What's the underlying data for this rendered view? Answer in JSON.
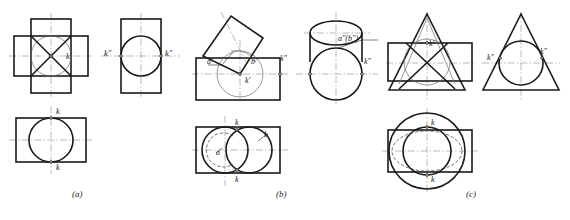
{
  "figure": {
    "title": "",
    "background": "#ffffff",
    "line_color": "#1a1a1a",
    "thin_color": "#5a5a5a",
    "center_color": "#7a7a7a",
    "hidden_color": "#4a4a4a"
  },
  "captions": [
    {
      "id": "cap-a",
      "label": "(a)",
      "x": 78,
      "y": 196
    },
    {
      "id": "cap-b",
      "label": "(b)",
      "x": 282,
      "y": 196
    },
    {
      "id": "cap-c",
      "label": "(c)",
      "x": 472,
      "y": 196
    }
  ],
  "panels": [
    {
      "id": "panel-a",
      "caption": "(a)",
      "description": "Cross-shaped prism with circle; front, side and top views",
      "views": [
        {
          "id": "a-front",
          "name": "front-view",
          "labels": [
            {
              "text": "k'",
              "x": 66,
              "y": 59
            }
          ]
        },
        {
          "id": "a-side",
          "name": "side-view",
          "labels": [
            {
              "text": "k\"",
              "x": 107,
              "y": 56
            },
            {
              "text": "k\"",
              "x": 168,
              "y": 56
            }
          ]
        },
        {
          "id": "a-top",
          "name": "top-view",
          "labels": [
            {
              "text": "k",
              "x": 59,
              "y": 111
            },
            {
              "text": "k",
              "x": 59,
              "y": 166
            }
          ]
        }
      ]
    },
    {
      "id": "panel-b",
      "caption": "(b)",
      "description": "Cylinder with tilted square prism; front, side and top views",
      "views": [
        {
          "id": "b-front",
          "name": "front-view",
          "labels": [
            {
              "text": "a'",
              "x": 207,
              "y": 62
            },
            {
              "text": "b'",
              "x": 253,
              "y": 63
            },
            {
              "text": "k'",
              "x": 250,
              "y": 80
            },
            {
              "text": "k\"",
              "x": 282,
              "y": 61
            }
          ]
        },
        {
          "id": "b-side",
          "name": "side-view",
          "labels": [
            {
              "text": "a\"(b\")",
              "x": 340,
              "y": 41
            },
            {
              "text": "k\"",
              "x": 366,
              "y": 63
            }
          ]
        },
        {
          "id": "b-top",
          "name": "top-view",
          "labels": [
            {
              "text": "k",
              "x": 252,
              "y": 121
            },
            {
              "text": "b",
              "x": 266,
              "y": 139
            },
            {
              "text": "a",
              "x": 223,
              "y": 152
            },
            {
              "text": "k",
              "x": 252,
              "y": 181
            }
          ]
        }
      ]
    },
    {
      "id": "panel-c",
      "caption": "(c)",
      "description": "Cone with rectangular prism; front, side and top views",
      "views": [
        {
          "id": "c-front",
          "name": "front-view",
          "labels": [
            {
              "text": "k'",
              "x": 427,
              "y": 47
            }
          ]
        },
        {
          "id": "c-side",
          "name": "side-view",
          "labels": [
            {
              "text": "k\"",
              "x": 491,
              "y": 58
            },
            {
              "text": "k\"",
              "x": 541,
              "y": 54
            }
          ]
        },
        {
          "id": "c-top",
          "name": "top-view",
          "labels": [
            {
              "text": "k",
              "x": 431,
              "y": 126
            },
            {
              "text": "k",
              "x": 431,
              "y": 176
            }
          ]
        }
      ]
    }
  ]
}
